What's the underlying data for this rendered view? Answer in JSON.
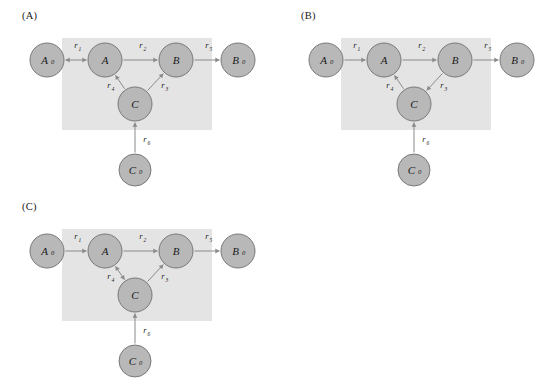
{
  "figure": {
    "background_color": "#ffffff",
    "node_fill_color": "#b8b8b8",
    "node_stroke_color": "#6f6f6f",
    "boundary_fill_color": "#e4e4e4",
    "edge_color": "#8a8a8a",
    "text_color": "#1a1a1a"
  },
  "panels": [
    {
      "id": "A",
      "label": "(A)",
      "nodes": [
        {
          "id": "A0",
          "base": "A",
          "sub": "0",
          "cx": 47,
          "cy": 60,
          "r": 17
        },
        {
          "id": "A",
          "base": "A",
          "sub": "",
          "cx": 105,
          "cy": 60,
          "r": 17
        },
        {
          "id": "B",
          "base": "B",
          "sub": "",
          "cx": 176,
          "cy": 60,
          "r": 17
        },
        {
          "id": "B0",
          "base": "B",
          "sub": "0",
          "cx": 238,
          "cy": 60,
          "r": 17
        },
        {
          "id": "C",
          "base": "C",
          "sub": "",
          "cx": 135,
          "cy": 104,
          "r": 17
        },
        {
          "id": "C0",
          "base": "C",
          "sub": "0",
          "cx": 135,
          "cy": 170,
          "r": 16
        }
      ],
      "boundary": {
        "x": 62,
        "y": 38,
        "width": 150,
        "height": 92
      },
      "edges": [
        {
          "id": "r1",
          "label": "r",
          "sub": "1",
          "from": "A0",
          "to": "A",
          "direction": "both",
          "label_x": 76,
          "label_y": 48
        },
        {
          "id": "r2",
          "label": "r",
          "sub": "2",
          "from": "A",
          "to": "B",
          "direction": "forward",
          "label_x": 141,
          "label_y": 48
        },
        {
          "id": "r5",
          "label": "r",
          "sub": "5",
          "from": "B",
          "to": "B0",
          "direction": "forward",
          "label_x": 207,
          "label_y": 48
        },
        {
          "id": "r4",
          "label": "r",
          "sub": "4",
          "from": "C",
          "to": "A",
          "direction": "forward",
          "label_x": 109,
          "label_y": 88
        },
        {
          "id": "r3",
          "label": "r",
          "sub": "3",
          "from": "C",
          "to": "B",
          "direction": "forward",
          "label_x": 163,
          "label_y": 88
        },
        {
          "id": "r6",
          "label": "r",
          "sub": "6",
          "from": "C0",
          "to": "C",
          "direction": "forward",
          "label_x": 145,
          "label_y": 142
        }
      ]
    },
    {
      "id": "B",
      "label": "(B)",
      "nodes": [
        {
          "id": "A0",
          "base": "A",
          "sub": "0",
          "cx": 47,
          "cy": 60,
          "r": 17
        },
        {
          "id": "A",
          "base": "A",
          "sub": "",
          "cx": 105,
          "cy": 60,
          "r": 17
        },
        {
          "id": "B",
          "base": "B",
          "sub": "",
          "cx": 176,
          "cy": 60,
          "r": 17
        },
        {
          "id": "B0",
          "base": "B",
          "sub": "0",
          "cx": 238,
          "cy": 60,
          "r": 17
        },
        {
          "id": "C",
          "base": "C",
          "sub": "",
          "cx": 135,
          "cy": 104,
          "r": 17
        },
        {
          "id": "C0",
          "base": "C",
          "sub": "0",
          "cx": 135,
          "cy": 170,
          "r": 16
        }
      ],
      "boundary": {
        "x": 62,
        "y": 38,
        "width": 150,
        "height": 92
      },
      "edges": [
        {
          "id": "r1",
          "label": "r",
          "sub": "1",
          "from": "A0",
          "to": "A",
          "direction": "forward",
          "label_x": 76,
          "label_y": 48
        },
        {
          "id": "r2",
          "label": "r",
          "sub": "2",
          "from": "A",
          "to": "B",
          "direction": "forward",
          "label_x": 141,
          "label_y": 48
        },
        {
          "id": "r5",
          "label": "r",
          "sub": "5",
          "from": "B",
          "to": "B0",
          "direction": "forward",
          "label_x": 207,
          "label_y": 48
        },
        {
          "id": "r4",
          "label": "r",
          "sub": "4",
          "from": "C",
          "to": "A",
          "direction": "forward",
          "label_x": 109,
          "label_y": 88
        },
        {
          "id": "r3",
          "label": "r",
          "sub": "3",
          "from": "B",
          "to": "C",
          "direction": "forward",
          "label_x": 163,
          "label_y": 88
        },
        {
          "id": "r6",
          "label": "r",
          "sub": "6",
          "from": "C0",
          "to": "C",
          "direction": "forward",
          "label_x": 145,
          "label_y": 142
        }
      ]
    },
    {
      "id": "C",
      "label": "(C)",
      "nodes": [
        {
          "id": "A0",
          "base": "A",
          "sub": "0",
          "cx": 47,
          "cy": 60,
          "r": 17
        },
        {
          "id": "A",
          "base": "A",
          "sub": "",
          "cx": 105,
          "cy": 60,
          "r": 17
        },
        {
          "id": "B",
          "base": "B",
          "sub": "",
          "cx": 176,
          "cy": 60,
          "r": 17
        },
        {
          "id": "B0",
          "base": "B",
          "sub": "0",
          "cx": 238,
          "cy": 60,
          "r": 17
        },
        {
          "id": "C",
          "base": "C",
          "sub": "",
          "cx": 135,
          "cy": 104,
          "r": 17
        },
        {
          "id": "C0",
          "base": "C",
          "sub": "0",
          "cx": 135,
          "cy": 170,
          "r": 16
        }
      ],
      "boundary": {
        "x": 62,
        "y": 38,
        "width": 150,
        "height": 92
      },
      "edges": [
        {
          "id": "r1",
          "label": "r",
          "sub": "1",
          "from": "A0",
          "to": "A",
          "direction": "forward",
          "label_x": 76,
          "label_y": 48
        },
        {
          "id": "r2",
          "label": "r",
          "sub": "2",
          "from": "A",
          "to": "B",
          "direction": "forward",
          "label_x": 141,
          "label_y": 48
        },
        {
          "id": "r5",
          "label": "r",
          "sub": "5",
          "from": "B",
          "to": "B0",
          "direction": "forward",
          "label_x": 207,
          "label_y": 48
        },
        {
          "id": "r4",
          "label": "r",
          "sub": "4",
          "from": "C",
          "to": "A",
          "direction": "both",
          "label_x": 109,
          "label_y": 88
        },
        {
          "id": "r3",
          "label": "r",
          "sub": "3",
          "from": "C",
          "to": "B",
          "direction": "forward",
          "label_x": 163,
          "label_y": 88
        },
        {
          "id": "r6",
          "label": "r",
          "sub": "6",
          "from": "C0",
          "to": "C",
          "direction": "forward",
          "label_x": 145,
          "label_y": 142
        }
      ]
    }
  ]
}
